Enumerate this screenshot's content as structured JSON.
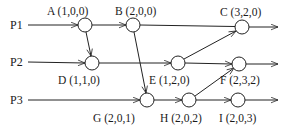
{
  "diagram": {
    "type": "space-time diagram (vector clocks)",
    "processes": [
      {
        "id": "P1",
        "label": "P1",
        "y": 25
      },
      {
        "id": "P2",
        "label": "P2",
        "y": 62
      },
      {
        "id": "P3",
        "label": "P3",
        "y": 100
      }
    ],
    "events": [
      {
        "id": "A",
        "label": "A (1,0,0)",
        "process": "P1",
        "x": 85,
        "y": 25,
        "label_pos": "above"
      },
      {
        "id": "B",
        "label": "B (2,0,0)",
        "process": "P1",
        "x": 133,
        "y": 25,
        "label_pos": "above"
      },
      {
        "id": "C",
        "label": "C (3,2,0)",
        "process": "P1",
        "x": 242,
        "y": 27,
        "label_pos": "above"
      },
      {
        "id": "D",
        "label": "D (1,1,0)",
        "process": "P2",
        "x": 92,
        "y": 63,
        "label_pos": "below"
      },
      {
        "id": "E",
        "label": "E (1,2,0)",
        "process": "P2",
        "x": 178,
        "y": 63,
        "label_pos": "below"
      },
      {
        "id": "F",
        "label": "F (2,3,2)",
        "process": "P2",
        "x": 239,
        "y": 64,
        "label_pos": "below"
      },
      {
        "id": "G",
        "label": "G (2,0,1)",
        "process": "P3",
        "x": 147,
        "y": 100,
        "label_pos": "below"
      },
      {
        "id": "H",
        "label": "H (2,0,2)",
        "process": "P3",
        "x": 189,
        "y": 100,
        "label_pos": "below"
      },
      {
        "id": "I",
        "label": "I (2,0,3)",
        "process": "P3",
        "x": 238,
        "y": 100,
        "label_pos": "below"
      }
    ],
    "messages": [
      {
        "from": "A",
        "to": "D"
      },
      {
        "from": "B",
        "to": "G"
      },
      {
        "from": "E",
        "to": "C"
      },
      {
        "from": "H",
        "to": "F"
      }
    ]
  }
}
